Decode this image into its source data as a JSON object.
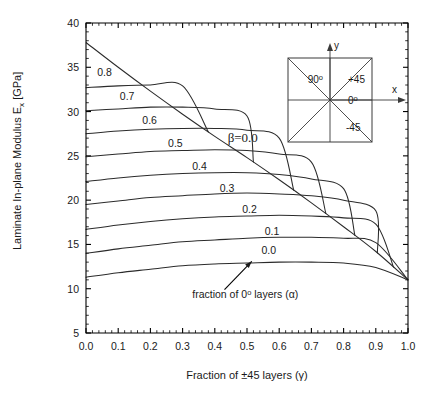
{
  "chart_data": {
    "type": "line",
    "title": "",
    "subtitle": "",
    "xlabel": "Fraction of ±45 layers (γ)",
    "ylabel": "Laminate In-plane Modulus E",
    "ylabel_sub": "x",
    "ylabel_unit": " [GPa]",
    "xlim": [
      0.0,
      1.0
    ],
    "ylim": [
      5,
      40
    ],
    "x_major_ticks": [
      0.0,
      0.1,
      0.2,
      0.3,
      0.4,
      0.5,
      0.6,
      0.7,
      0.8,
      0.9,
      1.0
    ],
    "x_tick_labels": [
      "0.0",
      "0.1",
      "0.2",
      "0.3",
      "0.4",
      "0.5",
      "0.6",
      "0.7",
      "0.8",
      "0.9",
      "1.0"
    ],
    "x_minor_step": 0.02,
    "y_major_ticks": [
      5,
      10,
      15,
      20,
      25,
      30,
      35,
      40
    ],
    "y_tick_labels": [
      "5",
      "10",
      "15",
      "20",
      "25",
      "30",
      "35",
      "40"
    ],
    "y_minor_step": 1,
    "grid": false,
    "legend_position": "inline-curve-labels",
    "x": [
      0.0,
      0.1,
      0.2,
      0.3,
      0.4,
      0.5,
      0.6,
      0.7,
      0.8,
      0.9,
      1.0
    ],
    "series": [
      {
        "name": "β=0.0",
        "label": "β=0.0",
        "label_x": 0.44,
        "label_y": 26.6,
        "values": [
          37.8,
          35.0,
          32.3,
          29.7,
          27.2,
          24.8,
          22.3,
          19.7,
          17.0,
          14.2,
          11.0
        ]
      },
      {
        "name": "α=0.8",
        "label": "0.8",
        "label_x": 0.035,
        "label_y": 34.0,
        "values": [
          32.7,
          32.9,
          33.0,
          32.9,
          32.2,
          29.7,
          22.3,
          19.7,
          17.0,
          14.2,
          11.0
        ],
        "truncate_at": 0.38
      },
      {
        "name": "α=0.7",
        "label": "0.7",
        "label_x": 0.105,
        "label_y": 31.3,
        "values": [
          30.1,
          30.3,
          30.5,
          30.5,
          30.3,
          29.5,
          22.3,
          19.7,
          17.0,
          14.2,
          11.0
        ],
        "truncate_at": 0.52
      },
      {
        "name": "α=0.6",
        "label": "0.6",
        "label_x": 0.175,
        "label_y": 28.6,
        "values": [
          27.5,
          27.8,
          28.0,
          28.1,
          28.1,
          27.9,
          27.0,
          19.7,
          17.0,
          14.2,
          11.0
        ],
        "truncate_at": 0.645
      },
      {
        "name": "α=0.5",
        "label": "0.5",
        "label_x": 0.255,
        "label_y": 26.0,
        "values": [
          24.9,
          25.2,
          25.5,
          25.6,
          25.7,
          25.6,
          25.2,
          24.3,
          17.0,
          14.2,
          11.0
        ],
        "truncate_at": 0.745
      },
      {
        "name": "α=0.4",
        "label": "0.4",
        "label_x": 0.33,
        "label_y": 23.4,
        "values": [
          22.1,
          22.5,
          22.8,
          23.0,
          23.1,
          23.1,
          22.9,
          22.4,
          21.3,
          14.2,
          11.0
        ],
        "truncate_at": 0.835
      },
      {
        "name": "α=0.3",
        "label": "0.3",
        "label_x": 0.415,
        "label_y": 20.9,
        "values": [
          19.5,
          19.9,
          20.3,
          20.5,
          20.7,
          20.8,
          20.7,
          20.5,
          20.0,
          18.8,
          11.0
        ],
        "truncate_at": 0.905
      },
      {
        "name": "α=0.2",
        "label": "0.2",
        "label_x": 0.485,
        "label_y": 18.5,
        "values": [
          16.7,
          17.2,
          17.6,
          17.9,
          18.1,
          18.2,
          18.3,
          18.2,
          18.0,
          17.3,
          11.0
        ],
        "truncate_at": 0.955
      },
      {
        "name": "α=0.1",
        "label": "0.1",
        "label_x": 0.555,
        "label_y": 16.1,
        "values": [
          14.0,
          14.5,
          14.9,
          15.3,
          15.5,
          15.7,
          15.8,
          15.8,
          15.7,
          15.2,
          11.0
        ]
      },
      {
        "name": "α=0.0",
        "label": "0.0",
        "label_x": 0.545,
        "label_y": 13.9,
        "values": [
          11.3,
          11.8,
          12.2,
          12.6,
          12.8,
          12.9,
          13.0,
          13.0,
          12.9,
          12.4,
          11.0
        ]
      }
    ],
    "annotations": [
      {
        "text": "fraction of 0° layers (α)",
        "text_plain": "fraction of 0",
        "text_sup": "o",
        "text_tail": " layers (α)",
        "x": 0.33,
        "y": 9.0,
        "arrow_from_x": 0.43,
        "arrow_from_y": 9.9,
        "arrow_to_x": 0.515,
        "arrow_to_y": 13.1
      }
    ]
  },
  "inset": {
    "name": "laminate-ply-orientation-diagram",
    "labels": {
      "y_axis": "y",
      "x_axis": "x",
      "ply_90": "90",
      "ply_90_sup": "o",
      "ply_plus45": "+45",
      "ply_0": "0",
      "ply_0_sup": "o",
      "ply_minus45": "-45"
    }
  },
  "colors": {
    "curve": "#2b2b2b",
    "axis": "#000000",
    "background": "#ffffff",
    "text": "#1a1a1a"
  }
}
